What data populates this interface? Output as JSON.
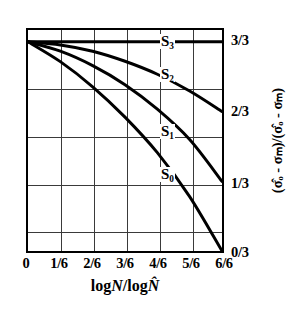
{
  "chart_data": {
    "type": "line",
    "title": "",
    "xlabel": "logN/logN̂",
    "ylabel": "(σ̂ₒ - σₘ)/(σ̂ₒ - σₘ)",
    "xlim": [
      0,
      1
    ],
    "ylim": [
      0,
      1
    ],
    "grid": true,
    "legend_position": "inline-curve-labels",
    "xtick_labels": [
      "0",
      "1/6",
      "2/6",
      "3/6",
      "4/6",
      "5/6",
      "6/6"
    ],
    "xtick_values": [
      0,
      0.16667,
      0.33333,
      0.5,
      0.66667,
      0.83333,
      1
    ],
    "ytick_labels": [
      "3/3",
      "2/3",
      "1/3",
      "0/3"
    ],
    "ytick_values": [
      1,
      0.66667,
      0.33333,
      0
    ],
    "series": [
      {
        "name": "S3",
        "label": "S",
        "sub": "3",
        "label_x": 0.695,
        "label_y": 0.945,
        "x": [
          0,
          0.1667,
          0.3333,
          0.5,
          0.6667,
          0.8333,
          1.0
        ],
        "y": [
          1.0,
          1.0,
          1.0,
          1.0,
          1.0,
          1.0,
          1.0
        ]
      },
      {
        "name": "S2",
        "label": "S",
        "sub": "2",
        "label_x": 0.695,
        "label_y": 0.8,
        "x": [
          0,
          0.1667,
          0.3333,
          0.5,
          0.6667,
          0.8333,
          1.0
        ],
        "y": [
          1.0,
          0.985,
          0.955,
          0.907,
          0.845,
          0.765,
          0.667
        ]
      },
      {
        "name": "S1",
        "label": "S",
        "sub": "1",
        "label_x": 0.695,
        "label_y": 0.545,
        "x": [
          0,
          0.1667,
          0.3333,
          0.5,
          0.6667,
          0.8333,
          1.0
        ],
        "y": [
          1.0,
          0.955,
          0.886,
          0.795,
          0.678,
          0.533,
          0.333
        ]
      },
      {
        "name": "S0",
        "label": "S",
        "sub": "0",
        "label_x": 0.695,
        "label_y": 0.355,
        "x": [
          0,
          0.1667,
          0.3333,
          0.5,
          0.6667,
          0.8333,
          1.0
        ],
        "y": [
          1.0,
          0.905,
          0.785,
          0.64,
          0.47,
          0.26,
          0.0
        ]
      }
    ],
    "colors": {
      "curve": "#000000",
      "frame": "#000000",
      "grid": "#3a3a3a",
      "background": "#ffffff"
    }
  },
  "axis": {
    "x_label_parts": {
      "log1": "log",
      "n1": "N",
      "slash": "/",
      "log2": "log",
      "n2": "N̂"
    },
    "y_label_text": "(σ̂ₒ - σₘ)/(σ̂ₒ - σₘ)"
  }
}
